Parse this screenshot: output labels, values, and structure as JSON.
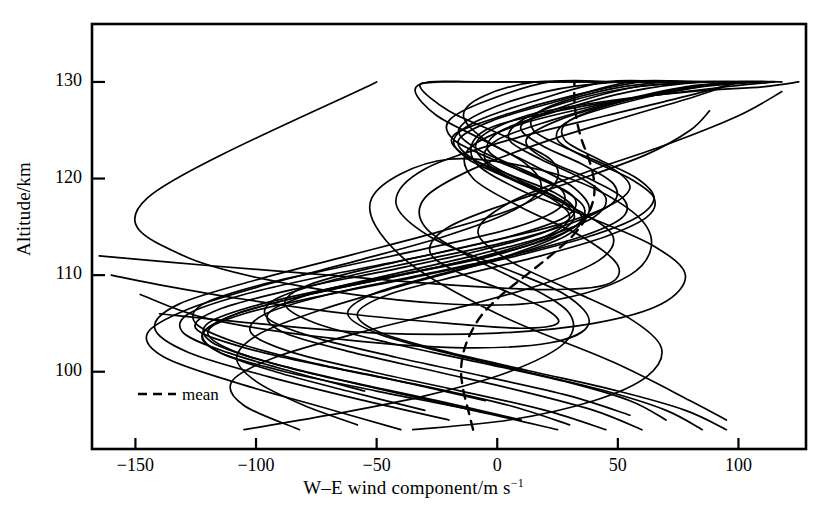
{
  "figure": {
    "y_axis_label": "Altitude/km",
    "x_axis_label_main": "W–E wind component/m s",
    "x_axis_label_exponent": "−1",
    "legend_label": "mean",
    "line_color": "#000000",
    "background_color": "#ffffff"
  },
  "chart_data": {
    "type": "line",
    "title": "",
    "xlabel": "W–E wind component/m s^-1",
    "ylabel": "Altitude/km",
    "xlim": [
      -168,
      128
    ],
    "ylim": [
      92,
      136
    ],
    "xticks": [
      -150,
      -100,
      -50,
      0,
      50,
      100
    ],
    "xtick_labels": [
      "−150",
      "−100",
      "−50",
      "0",
      "50",
      "100"
    ],
    "yticks": [
      100,
      110,
      120,
      130
    ],
    "ytick_labels": [
      "100",
      "110",
      "120",
      "130"
    ],
    "grid": false,
    "legend_position": "lower-left-inside",
    "legend_entries": [
      {
        "name": "mean",
        "style": "dashed",
        "color": "#000000"
      }
    ],
    "series": [
      {
        "name": "mean",
        "style": "dashed",
        "x": [
          -10,
          -12,
          -14,
          -15,
          -14,
          -11,
          -6,
          2,
          12,
          22,
          31,
          37,
          40,
          40,
          38,
          35,
          33,
          32,
          32
        ],
        "y": [
          94,
          96,
          98,
          100,
          102,
          104,
          106,
          108,
          110,
          112,
          114,
          116,
          118,
          120,
          122,
          124,
          126,
          128,
          130
        ]
      },
      {
        "name": "profile-1",
        "style": "solid",
        "x": [
          -40,
          -75,
          -110,
          -138,
          -145,
          -128,
          -96,
          -58,
          -22,
          5,
          18,
          12,
          -6,
          -25,
          -34,
          -28,
          -8,
          18,
          42,
          52
        ],
        "y": [
          94,
          96.5,
          99,
          101.5,
          104,
          106.5,
          109,
          111.5,
          114,
          116.5,
          119,
          121.5,
          124,
          126.5,
          129,
          130,
          130,
          130,
          130,
          130
        ]
      },
      {
        "name": "profile-2",
        "style": "solid",
        "x": [
          -20,
          -55,
          -95,
          -128,
          -142,
          -132,
          -100,
          -62,
          -24,
          8,
          24,
          22,
          2,
          -20,
          -32,
          -24,
          2,
          30,
          55
        ],
        "y": [
          95,
          97,
          99.5,
          102,
          104.5,
          107,
          109.5,
          112,
          114.5,
          117,
          119.5,
          122,
          124.5,
          127,
          129.5,
          130,
          130,
          130,
          130
        ]
      },
      {
        "name": "profile-3",
        "style": "solid",
        "x": [
          30,
          5,
          -30,
          -70,
          -105,
          -125,
          -115,
          -85,
          -45,
          -8,
          20,
          32,
          24,
          4,
          -14,
          -18,
          2,
          30,
          60,
          80
        ],
        "y": [
          94.5,
          96.5,
          98.5,
          100.5,
          102.5,
          104.5,
          106.5,
          108.5,
          110.5,
          112.5,
          114.5,
          116.5,
          118.5,
          120.5,
          122.5,
          124.5,
          126.5,
          128.5,
          130,
          130
        ]
      },
      {
        "name": "profile-4",
        "style": "solid",
        "x": [
          60,
          40,
          10,
          -25,
          -60,
          -88,
          -95,
          -78,
          -45,
          -10,
          20,
          40,
          45,
          35,
          18,
          5,
          10,
          30,
          58,
          85
        ],
        "y": [
          94,
          96,
          98,
          100,
          102,
          104,
          106,
          108,
          110,
          112,
          114,
          116,
          118,
          120,
          122,
          124,
          126,
          128,
          129.5,
          130
        ]
      },
      {
        "name": "profile-5",
        "style": "solid",
        "x": [
          -10,
          -45,
          -80,
          -108,
          -120,
          -108,
          -78,
          -40,
          -5,
          20,
          30,
          22,
          5,
          -12,
          -18,
          -8,
          15,
          45,
          72
        ],
        "y": [
          96,
          98,
          100,
          102,
          104,
          106,
          108,
          110,
          112,
          114,
          116,
          118,
          120,
          122,
          124,
          126,
          128,
          130,
          130
        ]
      },
      {
        "name": "profile-6",
        "style": "solid",
        "x": [
          70,
          55,
          28,
          -8,
          -45,
          -75,
          -88,
          -78,
          -48,
          -12,
          22,
          45,
          55,
          48,
          30,
          15,
          18,
          42,
          70,
          95
        ],
        "y": [
          95,
          97,
          99,
          101,
          103,
          105,
          107,
          109,
          111,
          113,
          115,
          117,
          119,
          121,
          123,
          125,
          127,
          129,
          130,
          130
        ]
      },
      {
        "name": "profile-7",
        "style": "solid",
        "x": [
          -55,
          -85,
          -112,
          -130,
          -128,
          -105,
          -70,
          -30,
          5,
          28,
          32,
          18,
          -2,
          -18,
          -20,
          -5,
          22,
          52,
          78
        ],
        "y": [
          98,
          100,
          102,
          104,
          106,
          108,
          110,
          112,
          114,
          116,
          118,
          120,
          122,
          124,
          126,
          128,
          130,
          130,
          130
        ]
      },
      {
        "name": "profile-8",
        "style": "solid",
        "x": [
          25,
          -10,
          -50,
          -88,
          -115,
          -122,
          -105,
          -70,
          -30,
          5,
          28,
          35,
          25,
          8,
          -5,
          0,
          22,
          50,
          78,
          100
        ],
        "y": [
          94,
          96,
          98,
          100,
          102,
          104,
          106,
          108,
          110,
          112,
          114,
          116,
          118,
          120,
          122,
          124,
          126,
          128,
          129.5,
          130
        ]
      },
      {
        "name": "profile-9",
        "style": "solid",
        "x": [
          85,
          70,
          45,
          12,
          -22,
          -50,
          -62,
          -52,
          -25,
          8,
          38,
          58,
          65,
          58,
          42,
          28,
          30,
          52,
          80,
          105
        ],
        "y": [
          94,
          96,
          98,
          100,
          102,
          104,
          106,
          108,
          110,
          112,
          114,
          116,
          118,
          120,
          122,
          124,
          126,
          128,
          129.5,
          130
        ]
      },
      {
        "name": "profile-10",
        "style": "solid",
        "x": [
          -160,
          -140,
          -105,
          -62,
          -20,
          10,
          25,
          20,
          2,
          -18,
          -28,
          -20,
          5,
          35,
          62,
          80,
          88
        ],
        "y": [
          110,
          109,
          107.5,
          106,
          105,
          104.5,
          105,
          106.5,
          108.5,
          110.5,
          112.5,
          115,
          117.5,
          120,
          122.5,
          125,
          127
        ]
      },
      {
        "name": "profile-11",
        "style": "solid",
        "x": [
          -58,
          -80,
          -100,
          -108,
          -98,
          -72,
          -38,
          -2,
          25,
          38,
          32,
          14,
          -5,
          -14,
          -6,
          16,
          45,
          72,
          95
        ],
        "y": [
          94.5,
          96.5,
          99,
          101.5,
          104,
          106.5,
          109,
          111.5,
          114,
          116.5,
          119,
          121.5,
          124,
          126.5,
          128.5,
          130,
          130,
          130,
          130
        ]
      },
      {
        "name": "profile-12",
        "style": "solid",
        "x": [
          10,
          -25,
          -62,
          -95,
          -118,
          -120,
          -98,
          -62,
          -22,
          12,
          32,
          36,
          26,
          8,
          -4,
          2,
          25,
          55,
          85,
          108
        ],
        "y": [
          95,
          97,
          99,
          101,
          103,
          105,
          107,
          109,
          111,
          113,
          115,
          117,
          119,
          121,
          123,
          125,
          127,
          129,
          130,
          130
        ]
      },
      {
        "name": "profile-13",
        "style": "solid",
        "x": [
          45,
          20,
          -15,
          -52,
          -85,
          -102,
          -96,
          -70,
          -32,
          5,
          35,
          52,
          52,
          38,
          20,
          12,
          25,
          52,
          82,
          105
        ],
        "y": [
          94,
          96,
          98,
          100,
          102,
          104,
          106,
          108,
          110,
          112,
          114,
          116,
          118,
          120,
          122,
          124,
          126,
          128,
          129.5,
          130
        ]
      },
      {
        "name": "profile-14",
        "style": "solid",
        "x": [
          -30,
          -62,
          -92,
          -115,
          -122,
          -108,
          -78,
          -40,
          -2,
          22,
          32,
          24,
          6,
          -10,
          -16,
          -2,
          25,
          55,
          82
        ],
        "y": [
          96,
          98,
          100,
          102,
          104,
          106,
          108,
          110,
          112,
          114,
          116,
          118,
          120,
          122,
          124,
          126,
          128,
          130,
          130
        ]
      },
      {
        "name": "profile-15",
        "style": "solid",
        "x": [
          95,
          78,
          50,
          15,
          -20,
          -48,
          -58,
          -45,
          -15,
          18,
          45,
          62,
          65,
          55,
          38,
          25,
          30,
          55,
          85,
          110
        ],
        "y": [
          94,
          96,
          98,
          100,
          102,
          104,
          106,
          108,
          110,
          112,
          114,
          116,
          118,
          120,
          122,
          124,
          126,
          128,
          129.5,
          130
        ]
      },
      {
        "name": "profile-16",
        "style": "solid",
        "x": [
          -5,
          -40,
          -78,
          -108,
          -125,
          -122,
          -98,
          -62,
          -25,
          8,
          26,
          26,
          10,
          -8,
          -16,
          -5,
          20,
          50,
          78
        ],
        "y": [
          97,
          99,
          101,
          103,
          105,
          107,
          109,
          111,
          113,
          115,
          117,
          119,
          121,
          123,
          125,
          127,
          129,
          130,
          130
        ]
      },
      {
        "name": "profile-17",
        "style": "solid",
        "x": [
          55,
          30,
          -5,
          -42,
          -75,
          -95,
          -92,
          -68,
          -32,
          5,
          32,
          48,
          48,
          35,
          18,
          10,
          28,
          58,
          88
        ],
        "y": [
          95.5,
          97.5,
          99.5,
          101.5,
          103.5,
          105.5,
          107.5,
          109.5,
          111.5,
          113.5,
          115.5,
          117.5,
          119.5,
          121.5,
          123.5,
          125.5,
          127.5,
          129.5,
          130
        ]
      },
      {
        "name": "profile-18",
        "style": "solid",
        "x": [
          -50,
          -145,
          -130,
          -60,
          10,
          55,
          62,
          30,
          -20,
          -52,
          -40,
          0,
          48,
          80,
          95
        ],
        "y": [
          130,
          118,
          112,
          108,
          107,
          110,
          115,
          120,
          122,
          118,
          112,
          106,
          101,
          97,
          95
        ]
      },
      {
        "name": "profile-19",
        "style": "solid",
        "x": [
          -148,
          -120,
          -70,
          -18,
          22,
          38,
          28,
          0,
          -28,
          -42,
          -30,
          5,
          45,
          78,
          100
        ],
        "y": [
          108,
          105.5,
          103.5,
          102.5,
          103,
          105,
          108,
          111,
          114,
          117.5,
          121,
          124,
          126.5,
          128.5,
          130
        ]
      },
      {
        "name": "profile-20",
        "style": "solid",
        "x": [
          -105,
          -70,
          -30,
          5,
          28,
          30,
          12,
          -12,
          -30,
          -30,
          -10,
          22,
          55,
          82,
          100
        ],
        "y": [
          94,
          95.5,
          97.5,
          100,
          103,
          106,
          109,
          112,
          115,
          118,
          121,
          124,
          126.5,
          128.5,
          130
        ]
      },
      {
        "name": "profile-21",
        "style": "solid",
        "x": [
          -165,
          -120,
          -70,
          -20,
          20,
          45,
          50,
          35,
          10,
          -10,
          -12,
          8,
          40,
          72,
          98,
          118
        ],
        "y": [
          112,
          111,
          110,
          109,
          108.5,
          109,
          111,
          114,
          117,
          120,
          123,
          125.5,
          127.5,
          129,
          130,
          130
        ]
      },
      {
        "name": "profile-22",
        "style": "solid",
        "x": [
          -82,
          -105,
          -110,
          -92,
          -58,
          -18,
          18,
          42,
          48,
          35,
          14,
          -4,
          -8,
          12,
          45,
          80,
          110,
          125
        ],
        "y": [
          94,
          96.5,
          99,
          101.5,
          104,
          106.5,
          109,
          111.5,
          114,
          116.5,
          119,
          121.5,
          124,
          126.5,
          128,
          129,
          129.5,
          130
        ]
      },
      {
        "name": "profile-23",
        "style": "solid",
        "x": [
          -35,
          5,
          40,
          62,
          68,
          55,
          30,
          5,
          -8,
          5,
          35,
          70,
          100,
          118
        ],
        "y": [
          94,
          95,
          97,
          99.5,
          102.5,
          105.5,
          108.5,
          111.5,
          114.5,
          117.5,
          120.5,
          123.5,
          126.5,
          129
        ]
      },
      {
        "name": "profile-24",
        "style": "solid",
        "x": [
          -140,
          -100,
          -50,
          0,
          40,
          68,
          78,
          65,
          38,
          8,
          -10,
          -5,
          25,
          62,
          95,
          115
        ],
        "y": [
          106,
          105,
          104,
          104,
          105,
          107,
          110,
          113,
          116,
          119,
          122,
          125,
          127,
          128.5,
          129.5,
          130
        ]
      }
    ]
  }
}
